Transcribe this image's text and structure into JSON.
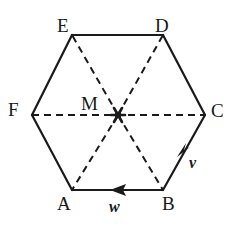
{
  "figure": {
    "name": "regular-hexagon-with-center-and-vectors",
    "background_color": "#ffffff",
    "stroke_color": "#1a1a1a",
    "geometry": {
      "vertices": {
        "E": {
          "x": 72,
          "y": 35
        },
        "D": {
          "x": 163,
          "y": 35
        },
        "C": {
          "x": 205,
          "y": 115
        },
        "B": {
          "x": 163,
          "y": 190
        },
        "A": {
          "x": 72,
          "y": 190
        },
        "F": {
          "x": 32,
          "y": 115
        }
      },
      "center": {
        "label": "M",
        "x": 118,
        "y": 115
      },
      "solid_edges": [
        [
          "E",
          "D"
        ],
        [
          "D",
          "C"
        ],
        [
          "C",
          "B"
        ],
        [
          "B",
          "A"
        ],
        [
          "A",
          "F"
        ],
        [
          "F",
          "E"
        ]
      ],
      "dashed_segments": [
        [
          "F",
          "C"
        ],
        [
          "M",
          "E"
        ],
        [
          "M",
          "D"
        ],
        [
          "M",
          "A"
        ],
        [
          "M",
          "B"
        ]
      ]
    },
    "labels": {
      "E": "E",
      "D": "D",
      "F": "F",
      "C": "C",
      "M": "M",
      "A": "A",
      "B": "B"
    },
    "vectors": [
      {
        "id": "v",
        "label": "v",
        "edge": "C-B",
        "direction": "down-left",
        "arrow_at": {
          "x": 180,
          "y": 152
        }
      },
      {
        "id": "w",
        "label": "w",
        "edge": "B-A",
        "direction": "left",
        "arrow_at": {
          "x": 117,
          "y": 190
        }
      }
    ]
  }
}
